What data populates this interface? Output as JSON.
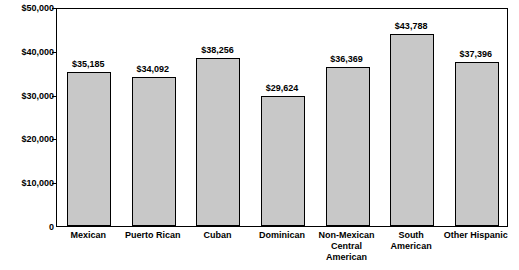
{
  "chart_data": {
    "type": "bar",
    "title": "",
    "subtitle": "",
    "xlabel": "",
    "ylabel": "",
    "categories": [
      "Mexican",
      "Puerto Rican",
      "Cuban",
      "Dominican",
      "Non-Mexican\nCentral American",
      "South American",
      "Other Hispanic"
    ],
    "category_lines": [
      [
        "Mexican"
      ],
      [
        "Puerto Rican"
      ],
      [
        "Cuban"
      ],
      [
        "Dominican"
      ],
      [
        "Non-Mexican",
        "Central American"
      ],
      [
        "South American"
      ],
      [
        "Other Hispanic"
      ]
    ],
    "values": [
      35185,
      34092,
      38256,
      29624,
      36369,
      43788,
      37396
    ],
    "value_labels": [
      "$35,185",
      "$34,092",
      "$38,256",
      "$29,624",
      "$36,369",
      "$43,788",
      "$37,396"
    ],
    "ylim": [
      0,
      50000
    ],
    "yticks": [
      0,
      10000,
      20000,
      30000,
      40000,
      50000
    ],
    "ytick_labels": [
      "0",
      "$10,000",
      "$20,000",
      "$30,000",
      "$40,000",
      "$50,000"
    ],
    "grid": false,
    "legend": null,
    "bar_color": "#c8c8c8",
    "bar_border_color": "#000000",
    "axis_color": "#000000",
    "text_color": "#000000"
  }
}
